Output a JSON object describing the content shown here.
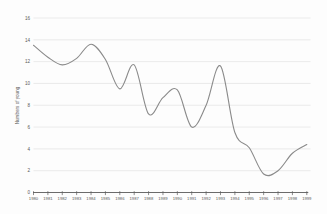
{
  "page": {
    "background_color": "#fdfdfd"
  },
  "chart_data": {
    "type": "line",
    "title": "",
    "xlabel": "",
    "ylabel": "Numbers of young",
    "x": [
      1980,
      1981,
      1982,
      1983,
      1984,
      1985,
      1986,
      1987,
      1988,
      1989,
      1990,
      1991,
      1992,
      1993,
      1994,
      1995,
      1996,
      1997,
      1998,
      1999
    ],
    "values": [
      13.5,
      12.4,
      11.7,
      12.3,
      13.6,
      12.2,
      9.5,
      11.7,
      7.2,
      8.7,
      9.4,
      6.0,
      8.0,
      11.6,
      5.5,
      4.1,
      1.7,
      2.0,
      3.6,
      4.4
    ],
    "ylim": [
      0,
      16
    ],
    "ytick_step": 2,
    "yticks": [
      0,
      2,
      4,
      6,
      8,
      10,
      12,
      14,
      16
    ],
    "grid": "horizontal",
    "legend_position": "none",
    "smooth": true,
    "marker": "none",
    "colors": {
      "line": "#8a8a8a",
      "grid": "#e2e2e2",
      "axis": "#5a5a5a",
      "tick_label": "#595959",
      "axis_title": "#595959"
    }
  }
}
